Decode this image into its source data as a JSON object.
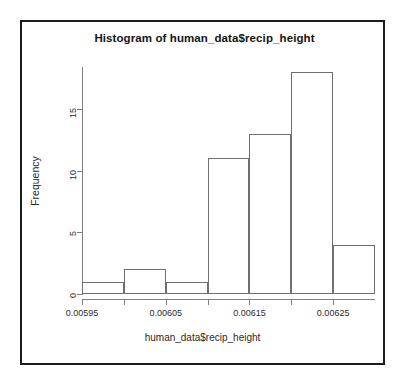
{
  "chart_data": {
    "type": "bar",
    "title": "Histogram of human_data$recip_height",
    "xlabel": "human_data$recip_height",
    "ylabel": "Frequency",
    "categories": [
      "0.00595-0.00600",
      "0.00600-0.00605",
      "0.00605-0.00610",
      "0.00610-0.00615",
      "0.00615-0.00620",
      "0.00620-0.00625",
      "0.00625-0.00630"
    ],
    "bin_edges": [
      0.00595,
      0.006,
      0.00605,
      0.0061,
      0.00615,
      0.0062,
      0.00625,
      0.0063
    ],
    "values": [
      1,
      2,
      1,
      11,
      13,
      18,
      4
    ],
    "xlim": [
      0.00595,
      0.0063
    ],
    "ylim": [
      0,
      18
    ],
    "xticks": [
      0.00595,
      0.006,
      0.00605,
      0.0061,
      0.00615,
      0.0062,
      0.00625
    ],
    "xtick_labels": [
      "0.00595",
      "",
      "0.00605",
      "",
      "0.00615",
      "",
      "0.00625"
    ],
    "yticks": [
      0,
      5,
      10,
      15
    ],
    "ytick_labels": [
      "0",
      "5",
      "10",
      "15"
    ],
    "grid": false,
    "legend": false,
    "bar_border_color": "#6f6f6f",
    "bar_fill_color": "transparent",
    "axis_color": "#808080",
    "frame_color": "#1c1c1c"
  }
}
